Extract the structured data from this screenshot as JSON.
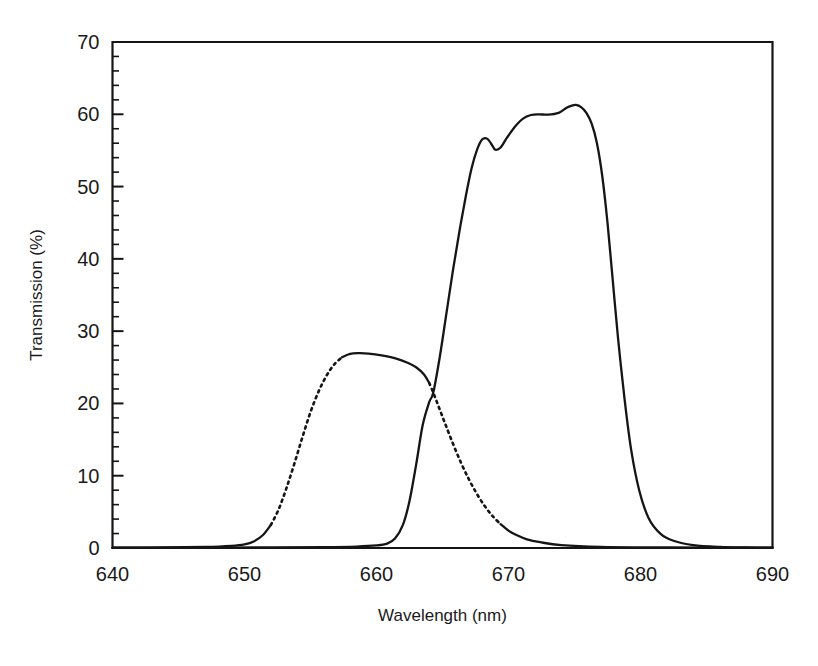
{
  "figure": {
    "background_color": "#ffffff",
    "line_color": "#151515",
    "width": 818,
    "height": 666
  },
  "chart_data": {
    "type": "line",
    "title": "",
    "subtitle": "",
    "xlabel": "Wavelength (nm)",
    "ylabel": "Transmission (%)",
    "xlim": [
      640,
      690
    ],
    "ylim": [
      0,
      70
    ],
    "xticks": [
      640,
      650,
      660,
      670,
      680,
      690
    ],
    "xtick_labels": [
      "640",
      "650",
      "660",
      "670",
      "680",
      "690"
    ],
    "yticks": [
      0,
      10,
      20,
      30,
      40,
      50,
      60,
      70
    ],
    "ytick_labels": [
      "0",
      "10",
      "20",
      "30",
      "40",
      "50",
      "60",
      "70"
    ],
    "y_minor_tick_step": 2,
    "x_minor_ticks": false,
    "grid": false,
    "legend": false,
    "legend_position": "none",
    "frame": "box",
    "annotations": [],
    "series": [
      {
        "name": "filter-a",
        "line_style": "dotted-edges-solid-plateau",
        "peak_x": 659.5,
        "peak_y": 26.9,
        "crossing_x": 664.3,
        "crossing_y": 21.5,
        "x": [
          640,
          644,
          647,
          649,
          650,
          650.7,
          651.4,
          652.0,
          652.6,
          653.2,
          653.8,
          654.4,
          655.0,
          655.6,
          656.2,
          656.8,
          657.4,
          658.0,
          658.6,
          659.4,
          660.5,
          661.5,
          662.4,
          663.0,
          663.6,
          664.0,
          664.3,
          664.7,
          665.2,
          665.8,
          666.4,
          667.0,
          667.6,
          668.2,
          668.8,
          669.4,
          670.0,
          670.6,
          671.4,
          672.4,
          674.0,
          677.0,
          681.0,
          685.0,
          690
        ],
        "y": [
          0.05,
          0.08,
          0.15,
          0.3,
          0.5,
          0.9,
          1.8,
          3.2,
          5.4,
          8.4,
          11.8,
          15.4,
          18.8,
          21.6,
          23.8,
          25.4,
          26.4,
          26.85,
          26.95,
          26.9,
          26.6,
          26.2,
          25.6,
          25.0,
          24.0,
          22.8,
          21.5,
          19.6,
          17.2,
          14.4,
          11.8,
          9.5,
          7.5,
          5.8,
          4.4,
          3.3,
          2.4,
          1.8,
          1.2,
          0.8,
          0.4,
          0.15,
          0.08,
          0.05,
          0.04
        ]
      },
      {
        "name": "filter-b",
        "line_style": "solid",
        "peak_x": 675.1,
        "peak_y": 61.3,
        "ripple_shoulder_x": 668.0,
        "ripple_shoulder_y": 56.6,
        "ripple_dip_x": 669.0,
        "ripple_dip_y": 55.1,
        "x": [
          640,
          646,
          652,
          656,
          658.5,
          660.0,
          660.8,
          661.4,
          662.0,
          662.5,
          663.0,
          663.5,
          664.0,
          664.3,
          664.8,
          665.3,
          665.8,
          666.3,
          666.8,
          667.2,
          667.6,
          668.0,
          668.4,
          668.8,
          669.0,
          669.4,
          669.9,
          670.5,
          671.1,
          671.7,
          672.3,
          673.0,
          673.8,
          674.4,
          674.8,
          675.1,
          675.5,
          675.9,
          676.3,
          676.7,
          677.1,
          677.5,
          677.9,
          678.3,
          678.8,
          679.3,
          679.9,
          680.6,
          681.5,
          682.5,
          684.0,
          686.0,
          688.0,
          690
        ],
        "y": [
          0.05,
          0.06,
          0.08,
          0.12,
          0.2,
          0.35,
          0.6,
          1.3,
          3.2,
          6.5,
          11.5,
          17.0,
          20.2,
          21.5,
          26.5,
          32.5,
          38.5,
          44.0,
          49.0,
          52.5,
          55.0,
          56.5,
          56.6,
          55.6,
          55.1,
          55.4,
          56.8,
          58.3,
          59.4,
          59.9,
          60.0,
          59.95,
          60.2,
          60.9,
          61.2,
          61.3,
          61.0,
          60.2,
          58.7,
          56.0,
          51.5,
          45.0,
          37.0,
          29.0,
          20.5,
          13.5,
          8.0,
          4.2,
          2.0,
          1.0,
          0.4,
          0.15,
          0.07,
          0.05
        ]
      }
    ]
  }
}
